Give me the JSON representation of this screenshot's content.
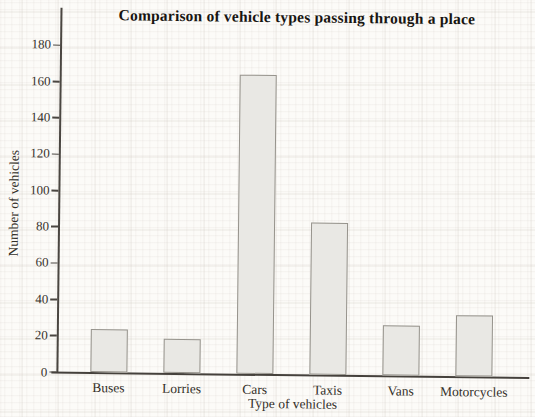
{
  "chart_data": {
    "type": "bar",
    "title": "Comparison of vehicle types passing through a place",
    "categories": [
      "Buses",
      "Lorries",
      "Cars",
      "Taxis",
      "Vans",
      "Motorcycles"
    ],
    "values": [
      24,
      19,
      165,
      84,
      28,
      34
    ],
    "xlabel": "Type of vehicles",
    "ylabel": "Number of vehicles",
    "ylim": [
      0,
      190
    ],
    "yticks": [
      0,
      20,
      40,
      60,
      80,
      100,
      120,
      140,
      160,
      180
    ],
    "grid": "faint graph-paper grid",
    "legend_position": "none"
  },
  "colors": {
    "paper": "#fcfbf8",
    "bar_fill": "#e9e8e4",
    "bar_border": "#96938c",
    "axis": "#45413c",
    "text": "#332f29"
  }
}
